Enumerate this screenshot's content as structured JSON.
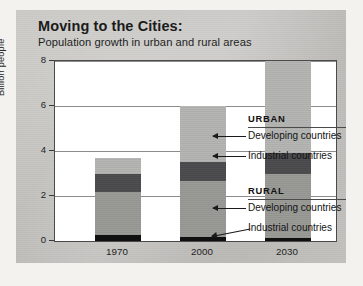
{
  "header": {
    "title": "Moving to the Cities:",
    "subtitle": "Population growth in urban and rural areas"
  },
  "annotations": {
    "urban_group": "URBAN",
    "rural_group": "RURAL",
    "urban_developing": "Developing countries",
    "urban_industrial": "Industrial countries",
    "rural_developing": "Developing countries",
    "rural_industrial": "Industrial countries"
  },
  "colors": {
    "urban_developing": "#b6b6b4",
    "urban_industrial": "#48484a",
    "rural_developing": "#9b9b98",
    "rural_industrial": "#101010",
    "paper": "#c9c8c4",
    "plot_background": "#ffffff",
    "axis": "#4a4a4a",
    "grid": "#8d8d8d"
  },
  "chart_data": {
    "type": "bar",
    "title": "Moving to the Cities:",
    "subtitle": "Population growth in urban and rural areas",
    "xlabel": "",
    "ylabel": "Billion people",
    "categories": [
      "1970",
      "2000",
      "2030"
    ],
    "yticks": [
      0,
      2,
      4,
      6,
      8
    ],
    "ylim": [
      0,
      8
    ],
    "grid": true,
    "stacked": true,
    "stack_order_bottom_to_top": [
      "Rural industrial countries",
      "Rural developing countries",
      "Urban industrial countries",
      "Urban developing countries"
    ],
    "legend": "right-side callouts with arrows",
    "series": [
      {
        "name": "Rural industrial countries",
        "values": [
          0.25,
          0.2,
          0.15
        ]
      },
      {
        "name": "Rural developing countries",
        "values": [
          1.95,
          2.45,
          2.85
        ]
      },
      {
        "name": "Urban industrial countries",
        "values": [
          0.8,
          0.85,
          0.9
        ]
      },
      {
        "name": "Urban developing countries",
        "values": [
          0.7,
          2.5,
          4.1
        ]
      }
    ],
    "totals": [
      3.7,
      6.0,
      8.0
    ]
  }
}
